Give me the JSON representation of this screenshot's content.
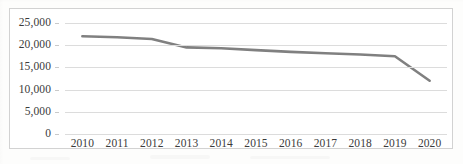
{
  "figure": {
    "frame_border_color": "#d2d2d2",
    "background_color": "#ffffff",
    "series_color": "#808080",
    "gridline_color": "#dcdcdc",
    "text_color": "#3b3b3b"
  },
  "chart_data": {
    "type": "line",
    "title": "",
    "subtitle": "",
    "xlabel": "",
    "ylabel": "",
    "categories": [
      "2010",
      "2011",
      "2012",
      "2013",
      "2014",
      "2015",
      "2016",
      "2017",
      "2018",
      "2019",
      "2020"
    ],
    "values": [
      22000,
      21800,
      21400,
      19500,
      19300,
      18900,
      18500,
      18200,
      17900,
      17500,
      12000
    ],
    "series": [
      {
        "name": "",
        "values": [
          22000,
          21800,
          21400,
          19500,
          19300,
          18900,
          18500,
          18200,
          17900,
          17500,
          12000
        ]
      }
    ],
    "ylim": [
      0,
      25000
    ],
    "yticks": [
      0,
      5000,
      10000,
      15000,
      20000,
      25000
    ],
    "ytick_labels": [
      "0",
      "5,000",
      "10,000",
      "15,000",
      "20,000",
      "25,000"
    ],
    "xtick_labels": [
      "2010",
      "2011",
      "2012",
      "2013",
      "2014",
      "2015",
      "2016",
      "2017",
      "2018",
      "2019",
      "2020"
    ],
    "grid": true,
    "grid_axis": "y",
    "legend": false,
    "legend_position": "none",
    "annotations": []
  }
}
